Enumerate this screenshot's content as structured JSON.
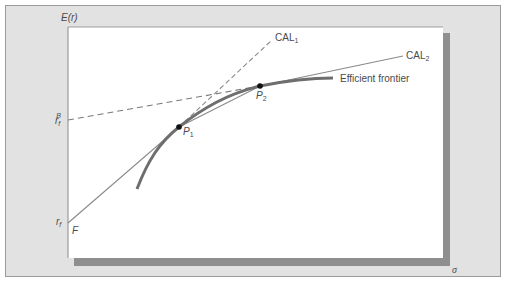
{
  "diagram": {
    "axes": {
      "y_label": "E(r)",
      "x_label": "σ"
    },
    "points": {
      "rf_label": "r",
      "rf_sub": "f",
      "rfB_label": "r",
      "rfB_sub": "f",
      "rfB_sup": "B",
      "F_label": "F",
      "P1_label": "P",
      "P1_sub": "1",
      "P2_label": "P",
      "P2_sub": "2"
    },
    "lines": {
      "cal1_label": "CAL",
      "cal1_sub": "1",
      "cal2_label": "CAL",
      "cal2_sub": "2",
      "frontier_label": "Efficient frontier"
    },
    "colors": {
      "panel_bg": "#e2e2e2",
      "panel_border": "#9a9a9a",
      "plot_bg": "#ffffff",
      "shadow": "#8f8f8f",
      "frontier": "#6e6e6e",
      "line": "#8a8a8a",
      "point": "#111111",
      "text": "#4a4a4a"
    }
  }
}
